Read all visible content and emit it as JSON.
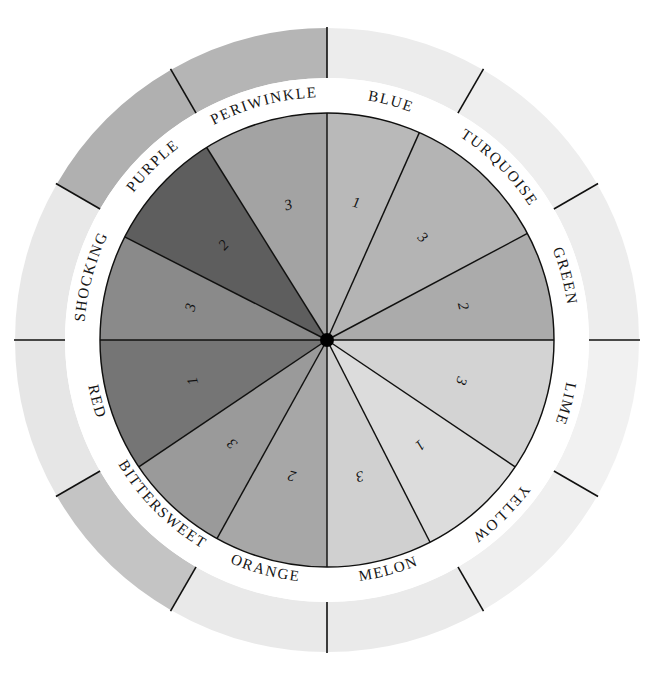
{
  "figure": {
    "kind": "color-wheel",
    "background_color": "#ffffff",
    "outline_color": "#10100f",
    "center_hub_color": "#000000",
    "white_band_color": "#ffffff"
  },
  "geometry": {
    "center_x": 327,
    "center_y": 340,
    "outer_ring_outer_radius": 312,
    "outer_ring_inner_radius": 262,
    "white_band_outer_radius": 262,
    "white_band_inner_radius": 227,
    "inner_disc_radius": 227,
    "hub_radius": 7,
    "ring_label_radius": 243,
    "segment_count": 12,
    "segment_span_degrees": 30,
    "first_segment_start_degrees": -90
  },
  "chart_data": {
    "type": "pie",
    "title": "",
    "categories": [
      "BLUE",
      "TURQUOISE",
      "GREEN",
      "LIME",
      "YELLOW",
      "MELON",
      "ORANGE",
      "BITTERSWEET",
      "RED",
      "SHOCKING",
      "PURPLE",
      "PERIWINKLE"
    ],
    "values": [
      30,
      30,
      30,
      30,
      30,
      30,
      30,
      30,
      30,
      30,
      30,
      30
    ],
    "series": [
      {
        "name": "sector value number",
        "values": [
          1,
          3,
          2,
          3,
          1,
          3,
          2,
          3,
          1,
          3,
          2,
          3
        ]
      }
    ],
    "legend_position": "outer-ring",
    "grid": false
  },
  "segments": [
    {
      "name": "BLUE",
      "number": "1",
      "start_deg": -90,
      "end_deg": -60,
      "inner_fill": "#b9b9b9",
      "ring_fill": "#ececec",
      "label_flip": false
    },
    {
      "name": "TURQUOISE",
      "number": "3",
      "start_deg": -60,
      "end_deg": -30,
      "inner_fill": "#b4b4b4",
      "ring_fill": "#eeeeee",
      "label_flip": false
    },
    {
      "name": "GREEN",
      "number": "2",
      "start_deg": -30,
      "end_deg": 0,
      "inner_fill": "#ababab",
      "ring_fill": "#ededed",
      "label_flip": false
    },
    {
      "name": "LIME",
      "number": "3",
      "start_deg": 0,
      "end_deg": 30,
      "inner_fill": "#d3d3d3",
      "ring_fill": "#f1f1f1",
      "label_flip": false
    },
    {
      "name": "YELLOW",
      "number": "1",
      "start_deg": 30,
      "end_deg": 60,
      "inner_fill": "#dcdcdc",
      "ring_fill": "#efefef",
      "label_flip": false
    },
    {
      "name": "MELON",
      "number": "3",
      "start_deg": 60,
      "end_deg": 90,
      "inner_fill": "#d0d0d0",
      "ring_fill": "#eaeaea",
      "label_flip": true
    },
    {
      "name": "ORANGE",
      "number": "2",
      "start_deg": 90,
      "end_deg": 120,
      "inner_fill": "#a7a7a7",
      "ring_fill": "#e9e9e9",
      "label_flip": true
    },
    {
      "name": "BITTERSWEET",
      "number": "3",
      "start_deg": 120,
      "end_deg": 150,
      "inner_fill": "#9a9a9a",
      "ring_fill": "#c4c4c4",
      "label_flip": true
    },
    {
      "name": "RED",
      "number": "1",
      "start_deg": 150,
      "end_deg": 180,
      "inner_fill": "#757575",
      "ring_fill": "#e6e6e6",
      "label_flip": true
    },
    {
      "name": "SHOCKING",
      "number": "3",
      "start_deg": 180,
      "end_deg": 210,
      "inner_fill": "#8a8a8a",
      "ring_fill": "#e8e8e8",
      "label_flip": false
    },
    {
      "name": "PURPLE",
      "number": "2",
      "start_deg": 210,
      "end_deg": 240,
      "inner_fill": "#5e5e5e",
      "ring_fill": "#b0b0b0",
      "label_flip": false
    },
    {
      "name": "PERIWINKLE",
      "number": "3",
      "start_deg": 240,
      "end_deg": 270,
      "inner_fill": "#a3a3a3",
      "ring_fill": "#b5b5b5",
      "label_flip": false
    }
  ],
  "inner_sector_edges_deg": [
    -90,
    -66,
    -28,
    0,
    34,
    63,
    90,
    119,
    146,
    180,
    207,
    238,
    270
  ]
}
